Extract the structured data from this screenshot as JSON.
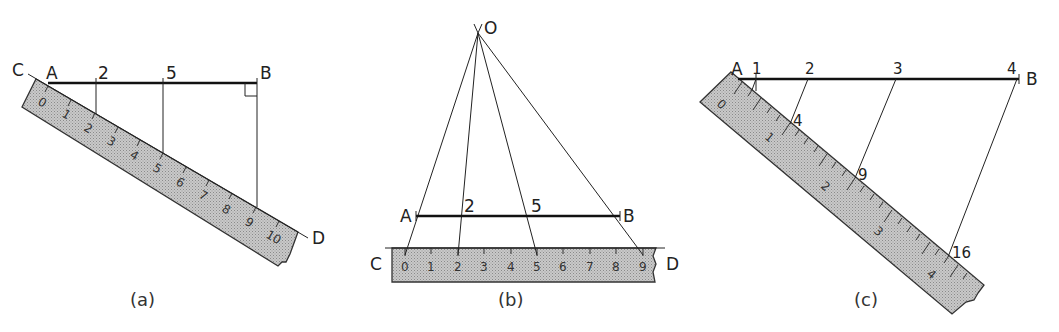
{
  "figure": {
    "panels": [
      {
        "id": "a",
        "caption": "(a)",
        "points": {
          "C": "C",
          "A": "A",
          "B": "B",
          "D": "D"
        },
        "line_marks": [
          "2",
          "5"
        ],
        "ruler_numbers": [
          "0",
          "1",
          "2",
          "3",
          "4",
          "5",
          "6",
          "7",
          "8",
          "9",
          "10"
        ],
        "right_angle_at": "B"
      },
      {
        "id": "b",
        "caption": "(b)",
        "points": {
          "O": "O",
          "A": "A",
          "B": "B",
          "C": "C",
          "D": "D"
        },
        "line_marks": [
          "2",
          "5"
        ],
        "ruler_numbers": [
          "0",
          "1",
          "2",
          "3",
          "4",
          "5",
          "6",
          "7",
          "8",
          "9"
        ]
      },
      {
        "id": "c",
        "caption": "(c)",
        "points": {
          "A": "A",
          "B": "B"
        },
        "line_marks": [
          "1",
          "2",
          "3",
          "4"
        ],
        "ruler_marks": [
          "4",
          "9",
          "16"
        ],
        "ruler_numbers": [
          "0",
          "1",
          "2",
          "3",
          "4"
        ]
      }
    ]
  }
}
